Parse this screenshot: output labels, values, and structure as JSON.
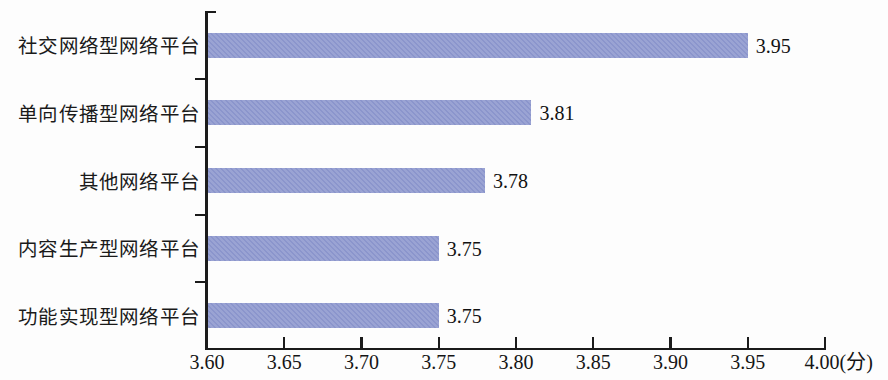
{
  "chart_data": {
    "type": "bar",
    "orientation": "horizontal",
    "title": "",
    "subtitle": "",
    "xlabel": "",
    "ylabel": "",
    "xlim": [
      3.6,
      4.0
    ],
    "xunit": "(分)",
    "grid": false,
    "legend": null,
    "bar_color": "#8b95cc",
    "axis_color": "#1b1b1b",
    "categories": [
      "社交网络型网络平台",
      "单向传播型网络平台",
      "其他网络平台",
      "内容生产型网络平台",
      "功能实现型网络平台"
    ],
    "values": [
      3.95,
      3.81,
      3.78,
      3.75,
      3.75
    ],
    "value_labels": [
      "3.95",
      "3.81",
      "3.78",
      "3.75",
      "3.75"
    ],
    "xticks": [
      3.6,
      3.65,
      3.7,
      3.75,
      3.8,
      3.85,
      3.9,
      3.95,
      4.0
    ],
    "xtick_labels": [
      "3.60",
      "3.65",
      "3.70",
      "3.75",
      "3.80",
      "3.85",
      "3.90",
      "3.95",
      "4.00(分)"
    ]
  }
}
